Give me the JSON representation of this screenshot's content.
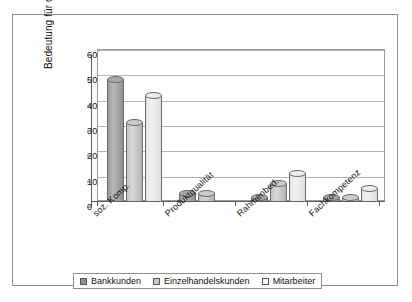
{
  "chart_data": {
    "type": "bar",
    "title": "",
    "subtitle": "",
    "xlabel": "",
    "ylabel": "Bedeutung für die Zufriedenheit in %",
    "ylim": [
      0,
      60
    ],
    "yticks": [
      "0",
      "10",
      "20",
      "30",
      "40",
      "50",
      "60"
    ],
    "grid": true,
    "legend_position": "bottom",
    "categories": [
      "soz. Komp.",
      "Produktqualität",
      "Rahmenbed.",
      "Fachkompetenz"
    ],
    "series": [
      {
        "name": "Bankkunden",
        "color": "#8f8f8f",
        "values": [
          48,
          3,
          1,
          1
        ]
      },
      {
        "name": "Einzelhandelskunden",
        "color": "#c9c9c9",
        "values": [
          31,
          3,
          7,
          1
        ]
      },
      {
        "name": "Mitarbeiter",
        "color": "#ffffff",
        "values": [
          42,
          0,
          11,
          5
        ]
      }
    ]
  },
  "legend": {
    "items": [
      {
        "label": "Bankkunden"
      },
      {
        "label": "Einzelhandelskunden"
      },
      {
        "label": "Mitarbeiter"
      }
    ]
  }
}
